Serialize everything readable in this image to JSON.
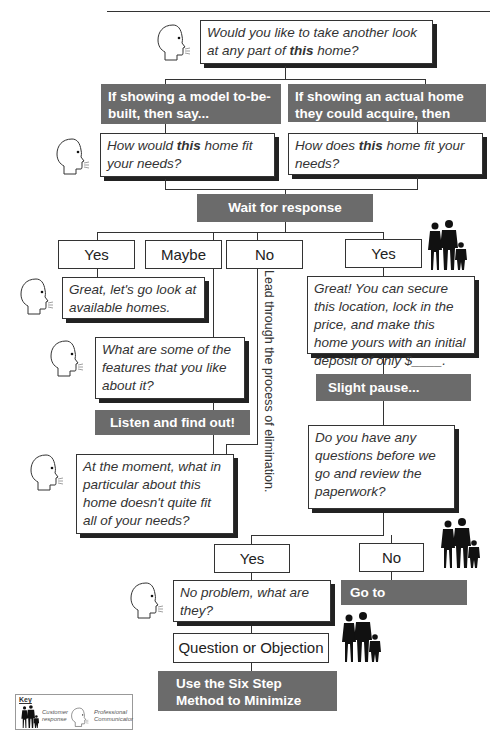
{
  "diagram": {
    "top_prompt": {
      "text_pre": "Would you like to take another look at any part of ",
      "bold": "this",
      "text_post": " home?"
    },
    "branch_left": {
      "label": "If showing a model to-be-built, then say..."
    },
    "branch_right": {
      "label": "If showing an actual home they could acquire, then say..."
    },
    "question_left": {
      "text_pre": "How would ",
      "bold": "this",
      "text_post": " home fit your needs?"
    },
    "question_right": {
      "text_pre": "How does ",
      "bold": "this",
      "text_post": " home fit your needs?"
    },
    "wait": {
      "label": "Wait for response"
    },
    "responses": [
      {
        "label": "Yes"
      },
      {
        "label": "Maybe"
      },
      {
        "label": "No"
      },
      {
        "label": "Yes"
      }
    ],
    "yes_left_reply": {
      "text": "Great, let's go look at available homes."
    },
    "maybe_reply": {
      "text": "What are some of the features that you like about it?"
    },
    "listen": {
      "label": "Listen and find out!"
    },
    "moment_reply": {
      "text": "At the moment, what in particular about this home doesn't quite fit all of your needs?"
    },
    "no_vertical": {
      "text": "Lead through the process of elimination."
    },
    "yes_right_reply": {
      "text": "Great! You can secure this location, lock in the price, and make this home yours with an initial deposit of only $____."
    },
    "pause": {
      "label": "Slight pause..."
    },
    "questions_reply": {
      "text": "Do you have any questions before we go and review the paperwork?"
    },
    "final_yes": {
      "label": "Yes"
    },
    "final_no": {
      "label": "No"
    },
    "no_problem": {
      "text": "No problem, what are they?"
    },
    "paperwork": {
      "label": "Go to paperwork."
    },
    "question_objection": {
      "label": "Question or Objection"
    },
    "six_step": {
      "label": "Use the Six Step Method to Minimize Objections."
    },
    "key": {
      "title": "Key",
      "customer": "Customer response",
      "professional": "Professional Communicator"
    }
  }
}
